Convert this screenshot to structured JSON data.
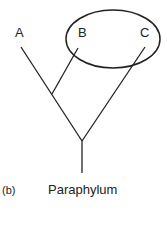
{
  "diagram": {
    "taxa": [
      {
        "label": "A",
        "x": 21,
        "y": 33
      },
      {
        "label": "B",
        "x": 83,
        "y": 33
      },
      {
        "label": "C",
        "x": 145,
        "y": 33
      }
    ],
    "panel_label": "(b)",
    "caption": "Paraphylum",
    "colors": {
      "line": "#222222",
      "background": "#ffffff"
    }
  }
}
